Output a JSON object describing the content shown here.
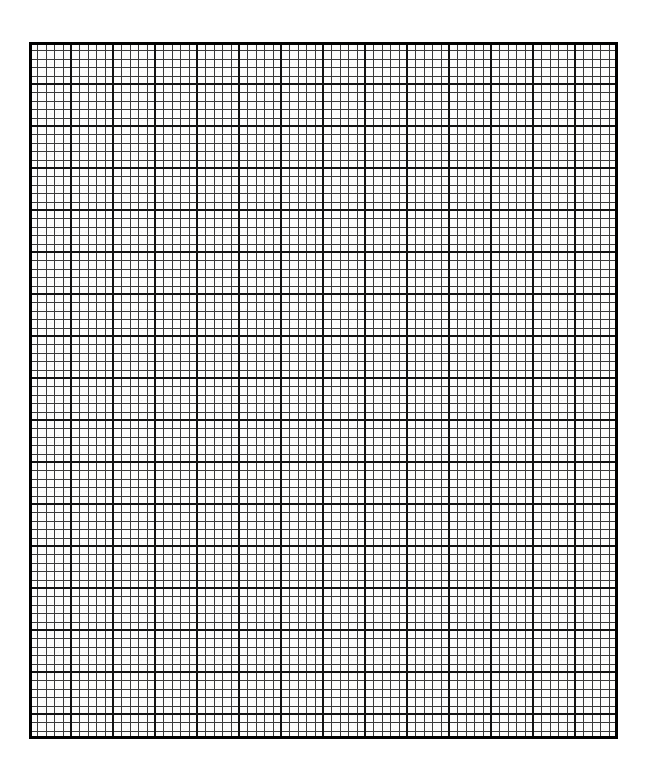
{
  "page": {
    "width": 647,
    "height": 771,
    "background_color": "#ffffff"
  },
  "sheet": {
    "name": "graph-paper-grid",
    "description": "Blank engineering graph paper, 5 minor squares per major square",
    "paper_color": "#fdfdfc",
    "left": 29,
    "top": 42,
    "width": 589,
    "height": 697
  },
  "grid": {
    "minor": {
      "label": "minor-gridline",
      "spacing_px": 8.4,
      "line_width_px": 1,
      "color": "#3a3a3a"
    },
    "major": {
      "label": "major-gridline",
      "spacing_px": 42,
      "minor_per_major": 5,
      "line_width_px": 2.4,
      "color": "#111111"
    },
    "border": {
      "label": "sheet-border",
      "line_width_px": 3,
      "color": "#000000"
    },
    "columns": {
      "major": 14,
      "minor": 70
    },
    "rows": {
      "major": 17,
      "minor": 83
    }
  },
  "chart_data": {
    "type": "table",
    "title": "",
    "xlabel": "",
    "ylabel": "",
    "grid": true,
    "legend": null,
    "categories": [],
    "values": []
  }
}
